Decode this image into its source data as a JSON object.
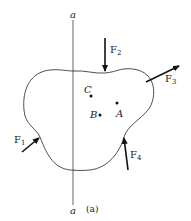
{
  "diagram": {
    "axis_labels": {
      "top": "a",
      "bottom": "a"
    },
    "forces": [
      {
        "name": "F",
        "sub": "1"
      },
      {
        "name": "F",
        "sub": "2"
      },
      {
        "name": "F",
        "sub": "3"
      },
      {
        "name": "F",
        "sub": "4"
      }
    ],
    "points": [
      {
        "label": "C"
      },
      {
        "label": "A"
      },
      {
        "label": "B"
      }
    ],
    "caption": "(a)"
  }
}
